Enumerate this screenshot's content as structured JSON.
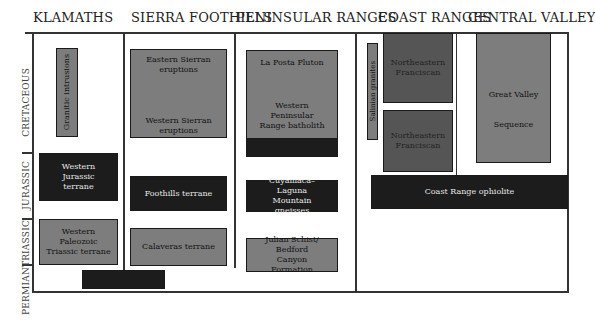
{
  "columns": [
    {
      "name": "KLAMATHS"
    },
    {
      "name": "SIERRA FOOTHILLS"
    },
    {
      "name": "PENINSULAR RANGES"
    },
    {
      "name": "COAST RANGES"
    },
    {
      "name": "CENTRAL VALLEY"
    }
  ],
  "periods": [
    "CRETACEOUS",
    "JURASSIC",
    "TRIASSIC",
    "PERMIAN"
  ],
  "units": {
    "klamaths": {
      "granitic": "Granitic intrusions",
      "western_jurassic": "Western Jurassic terrane",
      "western_paleozoic": "Western Paleozoic Triassic terrane",
      "permian_box": ""
    },
    "sierra": {
      "eastern": "Eastern Sierran eruptions",
      "western": "Western Sierran eruptions",
      "foothills": "Foothills terrane",
      "calaveras": "Calaveras terrane"
    },
    "peninsular": {
      "la_posta": "La Posta Pluton",
      "batholith": "Western Peninsular Range batholith",
      "dark_strip": "",
      "cuyamaca": "Cuyamaca–Laguna Mountain gneisses",
      "julian": "Julian Schist/ Bedford Canyon Formation"
    },
    "coast": {
      "salinian": "Salinian granites",
      "franciscan_upper": "Northeastern Franciscan",
      "franciscan_lower": "Northeastern Franciscan",
      "ophiolite": "Coast Range ophiolite"
    },
    "central": {
      "great_valley_1": "Great Valley",
      "great_valley_2": "Sequence"
    }
  },
  "colors": {
    "gray": "#7d7d7d",
    "dark_gray": "#555555",
    "black": "#1c1c1c"
  }
}
